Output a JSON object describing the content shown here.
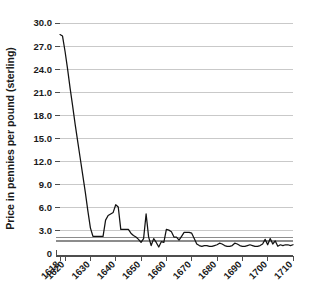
{
  "chart_data": {
    "type": "line",
    "title": "",
    "subtitle": "",
    "xlabel": "",
    "ylabel": "Price in pennies per pound (sterling)",
    "xlim": [
      1618,
      1710
    ],
    "ylim": [
      0,
      30
    ],
    "grid": true,
    "legend": "none",
    "y_ticks": [
      0,
      3.0,
      6.0,
      9.0,
      12.0,
      15.0,
      18.0,
      21.0,
      24.0,
      27.0,
      30.0
    ],
    "y_tick_labels": [
      "0",
      "3.0",
      "6.0",
      "9.0",
      "12.0",
      "15.0",
      "18.0",
      "21.0",
      "24.0",
      "27.0",
      "30.0"
    ],
    "x_ticks": [
      1618,
      1620,
      1630,
      1640,
      1650,
      1660,
      1670,
      1680,
      1690,
      1700,
      1710
    ],
    "x_tick_labels": [
      "1618",
      "1620",
      "1630",
      "1640",
      "1650",
      "1660",
      "1670",
      "1680",
      "1690",
      "1700",
      "1710"
    ],
    "series": [
      {
        "name": "Tobacco price",
        "color": "#121212",
        "x": [
          1618,
          1619,
          1620,
          1621,
          1622,
          1623,
          1624,
          1625,
          1626,
          1627,
          1628,
          1629,
          1630,
          1631,
          1632,
          1633,
          1634,
          1635,
          1636,
          1637,
          1638,
          1639,
          1640,
          1641,
          1642,
          1643,
          1644,
          1645,
          1646,
          1647,
          1648,
          1649,
          1650,
          1651,
          1652,
          1653,
          1654,
          1655,
          1656,
          1657,
          1658,
          1659,
          1660,
          1661,
          1662,
          1663,
          1664,
          1665,
          1666,
          1667,
          1668,
          1669,
          1670,
          1671,
          1672,
          1673,
          1674,
          1675,
          1676,
          1677,
          1678,
          1679,
          1680,
          1681,
          1682,
          1683,
          1684,
          1685,
          1686,
          1687,
          1688,
          1689,
          1690,
          1691,
          1692,
          1693,
          1694,
          1695,
          1696,
          1697,
          1698,
          1699,
          1700,
          1701,
          1702,
          1703,
          1704,
          1705,
          1706,
          1707,
          1708,
          1709,
          1710
        ],
        "values": [
          28.5,
          28.3,
          26.3,
          24.0,
          21.5,
          19.2,
          16.8,
          14.6,
          12.4,
          10.2,
          8.0,
          5.6,
          3.4,
          2.3,
          2.3,
          2.3,
          2.3,
          2.3,
          4.4,
          5.0,
          5.2,
          5.4,
          6.4,
          6.1,
          3.2,
          3.2,
          3.2,
          3.2,
          2.7,
          2.4,
          2.2,
          1.9,
          1.5,
          2.0,
          5.2,
          2.2,
          1.1,
          2.0,
          1.5,
          0.9,
          1.6,
          1.5,
          3.2,
          3.1,
          2.9,
          2.2,
          2.2,
          1.8,
          2.3,
          2.8,
          2.8,
          2.8,
          2.7,
          2.0,
          1.3,
          1.1,
          1.0,
          1.1,
          1.1,
          1.0,
          1.0,
          1.1,
          1.2,
          1.4,
          1.3,
          1.1,
          1.0,
          1.0,
          1.1,
          1.4,
          1.3,
          1.1,
          1.0,
          1.0,
          1.1,
          1.2,
          1.1,
          1.0,
          1.0,
          1.1,
          1.3,
          1.9,
          1.2,
          2.0,
          1.3,
          1.7,
          1.0,
          1.2,
          1.1,
          1.2,
          1.2,
          1.1,
          1.2
        ]
      }
    ],
    "reference_bands": [
      {
        "name": "upper-reference-line",
        "value": 2.15,
        "color": "#8c8c8c"
      },
      {
        "name": "lower-reference-line",
        "value": 1.65,
        "color": "#8c8c8c"
      }
    ]
  }
}
